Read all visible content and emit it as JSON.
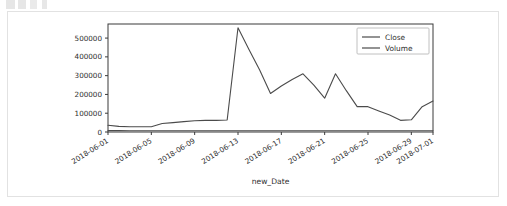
{
  "card": {
    "border_color": "#e2e2e2",
    "background": "#ffffff"
  },
  "chart_data": {
    "type": "line",
    "title": "",
    "xlabel": "new_Date",
    "ylabel": "",
    "grid": false,
    "legend_position": "upper right",
    "xlim": [
      "2018-05-31",
      "2018-07-02"
    ],
    "ylim": [
      0,
      575000
    ],
    "yticks": [
      0,
      100000,
      200000,
      300000,
      400000,
      500000
    ],
    "ytick_labels": [
      "0",
      "100000",
      "200000",
      "300000",
      "400000",
      "500000"
    ],
    "xtick_labels": [
      "2018-06-01",
      "2018-06-05",
      "2018-06-09",
      "2018-06-13",
      "2018-06-17",
      "2018-06-21",
      "2018-06-25",
      "2018-06-29",
      "2018-07-01"
    ],
    "x": [
      "2018-06-01",
      "2018-06-02",
      "2018-06-03",
      "2018-06-04",
      "2018-06-05",
      "2018-06-06",
      "2018-06-07",
      "2018-06-08",
      "2018-06-09",
      "2018-06-10",
      "2018-06-11",
      "2018-06-12",
      "2018-06-13",
      "2018-06-14",
      "2018-06-15",
      "2018-06-16",
      "2018-06-17",
      "2018-06-18",
      "2018-06-19",
      "2018-06-20",
      "2018-06-21",
      "2018-06-22",
      "2018-06-23",
      "2018-06-24",
      "2018-06-25",
      "2018-06-26",
      "2018-06-27",
      "2018-06-28",
      "2018-06-29",
      "2018-06-30",
      "2018-07-01"
    ],
    "series": [
      {
        "name": "Close",
        "color": "#555555",
        "values": [
          7200,
          7100,
          7000,
          6900,
          6900,
          6900,
          6900,
          6900,
          6900,
          6900,
          6900,
          6800,
          6800,
          6700,
          6700,
          6700,
          6700,
          6600,
          6600,
          6600,
          6600,
          6600,
          6500,
          6500,
          6500,
          6500,
          6500,
          6500,
          6500,
          6500,
          6500
        ]
      },
      {
        "name": "Volume",
        "color": "#4b4b4b",
        "values": [
          36000,
          30000,
          28000,
          28000,
          28000,
          45000,
          50000,
          55000,
          60000,
          62000,
          62000,
          64000,
          555000,
          440000,
          330000,
          205000,
          245000,
          280000,
          310000,
          250000,
          180000,
          310000,
          220000,
          135000,
          135000,
          112000,
          90000,
          62000,
          65000,
          135000,
          165000
        ]
      }
    ],
    "legend": [
      {
        "label": "Close"
      },
      {
        "label": "Volume"
      }
    ]
  },
  "artifact": {
    "top_cutoff_text": ""
  }
}
